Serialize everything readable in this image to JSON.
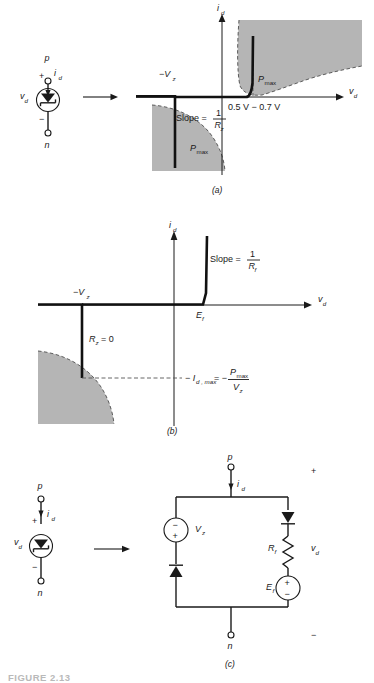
{
  "figure": {
    "caption_code": "FIGURE 2.13",
    "panels": [
      {
        "id": "a",
        "label": "(a)"
      },
      {
        "id": "b",
        "label": "(b)"
      },
      {
        "id": "c",
        "label": "(c)"
      }
    ]
  },
  "panel_a": {
    "symbol": {
      "terminal_top": "p",
      "terminal_bottom": "n",
      "current_label": "i",
      "current_sub": "d",
      "voltage_label": "v",
      "voltage_sub": "d",
      "polarity_plus": "+",
      "polarity_minus": "−",
      "device": "zener-diode"
    },
    "graph": {
      "x_axis_label": "v",
      "x_axis_sub": "d",
      "y_axis_label": "i",
      "y_axis_sub": "d",
      "breakdown_label": "−V",
      "breakdown_sub": "z",
      "forward_knee_text": "0.5 V − 0.7 V",
      "slope_text": "Slope =",
      "slope_numerator": "1",
      "slope_denominator": "R",
      "slope_denominator_sub": "z",
      "pmax_label": "P",
      "pmax_sub": "max",
      "pmax_label_2": "P",
      "pmax_sub_2": "max"
    }
  },
  "panel_b": {
    "graph": {
      "x_axis_label": "v",
      "x_axis_sub": "d",
      "y_axis_label": "i",
      "y_axis_sub": "d",
      "breakdown_label": "−V",
      "breakdown_sub": "z",
      "forward_offset_label": "E",
      "forward_offset_sub": "f",
      "slope_text": "Slope =",
      "slope_numerator": "1",
      "slope_denominator": "R",
      "slope_denominator_sub": "f",
      "rz_label": "R",
      "rz_sub": "z",
      "rz_value": "= 0",
      "idmax_lead": "− I",
      "idmax_sub": "d , max",
      "idmax_eq": "= −",
      "idmax_num": "P",
      "idmax_num_sub": "max",
      "idmax_den": "V",
      "idmax_den_sub": "z"
    }
  },
  "panel_c": {
    "symbol": {
      "terminal_top": "p",
      "terminal_bottom": "n",
      "current_label": "i",
      "current_sub": "d",
      "voltage_label": "v",
      "voltage_sub": "d",
      "polarity_plus": "+",
      "polarity_minus": "−",
      "device": "zener-diode"
    },
    "circuit": {
      "terminal_top": "p",
      "terminal_bottom": "n",
      "current_label": "i",
      "current_sub": "d",
      "source_left_label": "V",
      "source_left_sub": "z",
      "source_left_top_sign": "−",
      "source_left_bottom_sign": "+",
      "resistor_label": "R",
      "resistor_sub": "f",
      "source_right_label": "E",
      "source_right_sub": "f",
      "source_right_top_sign": "+",
      "source_right_bottom_sign": "−",
      "port_voltage_label": "v",
      "port_voltage_sub": "d",
      "port_plus": "+",
      "port_minus": "−"
    }
  },
  "colors": {
    "ink": "#1a1a1a",
    "curve": "#111111",
    "shade_fill": "#b5b5b5",
    "shade_edge": "#4d4d4d",
    "caption_grey": "#b9b9b9"
  }
}
